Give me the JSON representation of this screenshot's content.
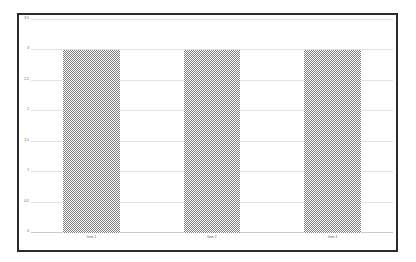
{
  "chart_data": {
    "type": "bar",
    "title": "",
    "subtitle": "",
    "xlabel": "",
    "ylabel": "",
    "categories": [
      "Item 1",
      "Item 2",
      "Item 3"
    ],
    "values": [
      3,
      3,
      3
    ],
    "series": [
      {
        "name": "",
        "values": [
          3,
          3,
          3
        ]
      }
    ],
    "ylim": [
      0,
      3.5
    ],
    "ytick_labels": [
      "0",
      "0.5",
      "1",
      "1.5",
      "2",
      "2.5",
      "3",
      "3.5"
    ],
    "ytick_values": [
      0,
      0.5,
      1,
      1.5,
      2,
      2.5,
      3,
      3.5
    ],
    "grid": "horizontal",
    "legend": "none",
    "bar_color": "#7d7d7d",
    "bar_fill": "checkered-dither",
    "plot_background": "#ffffff",
    "figure_background": "#ffffff",
    "frame_color": "#2b2b2b",
    "gridline_color": "#e2e2e2"
  }
}
